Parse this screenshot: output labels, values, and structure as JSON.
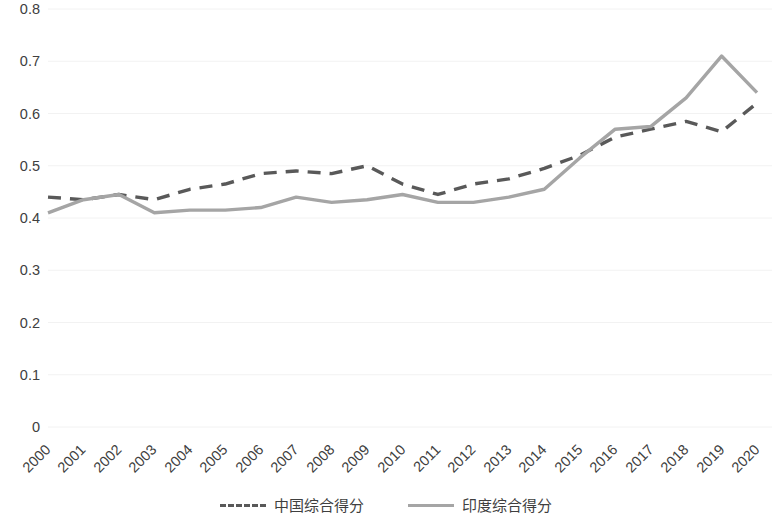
{
  "chart_data": {
    "type": "line",
    "title": "",
    "subtitle": "",
    "xlabel": "",
    "ylabel": "",
    "categories": [
      "2000",
      "2001",
      "2002",
      "2003",
      "2004",
      "2005",
      "2006",
      "2007",
      "2008",
      "2009",
      "2010",
      "2011",
      "2012",
      "2013",
      "2014",
      "2015",
      "2016",
      "2017",
      "2018",
      "2019",
      "2020"
    ],
    "ylim": [
      0,
      0.8
    ],
    "xlim": [
      "2000",
      "2020"
    ],
    "y_ticks": [
      "0",
      "0.1",
      "0.2",
      "0.3",
      "0.4",
      "0.5",
      "0.6",
      "0.7",
      "0.8"
    ],
    "y_tick_values": [
      0,
      0.1,
      0.2,
      0.3,
      0.4,
      0.5,
      0.6,
      0.7,
      0.8
    ],
    "grid": "horizontal",
    "legend_position": "bottom",
    "series": [
      {
        "name": "中国综合得分",
        "style": "dashed",
        "color": "#595959",
        "values": [
          0.44,
          0.435,
          0.445,
          0.435,
          0.455,
          0.465,
          0.485,
          0.49,
          0.485,
          0.5,
          0.465,
          0.445,
          0.465,
          0.475,
          0.495,
          0.52,
          0.555,
          0.57,
          0.585,
          0.565,
          0.62
        ]
      },
      {
        "name": "印度综合得分",
        "style": "solid",
        "color": "#a5a5a5",
        "values": [
          0.41,
          0.435,
          0.445,
          0.41,
          0.415,
          0.415,
          0.42,
          0.44,
          0.43,
          0.435,
          0.445,
          0.43,
          0.43,
          0.44,
          0.455,
          0.515,
          0.57,
          0.575,
          0.63,
          0.71,
          0.64
        ]
      }
    ]
  },
  "legend": {
    "items": [
      {
        "label": "中国综合得分",
        "color": "#595959",
        "style": "dashed"
      },
      {
        "label": "印度综合得分",
        "color": "#a5a5a5",
        "style": "solid"
      }
    ]
  },
  "axis": {
    "y_labels": [
      "0.8",
      "0.7",
      "0.6",
      "0.5",
      "0.4",
      "0.3",
      "0.2",
      "0.1",
      "0"
    ],
    "x_labels": [
      "2000",
      "2001",
      "2002",
      "2003",
      "2004",
      "2005",
      "2006",
      "2007",
      "2008",
      "2009",
      "2010",
      "2011",
      "2012",
      "2013",
      "2014",
      "2015",
      "2016",
      "2017",
      "2018",
      "2019",
      "2020"
    ]
  },
  "colors": {
    "grid": "#f2f2f2",
    "axis_text": "#404040",
    "series_china": "#595959",
    "series_india": "#a5a5a5",
    "background": "#ffffff"
  }
}
